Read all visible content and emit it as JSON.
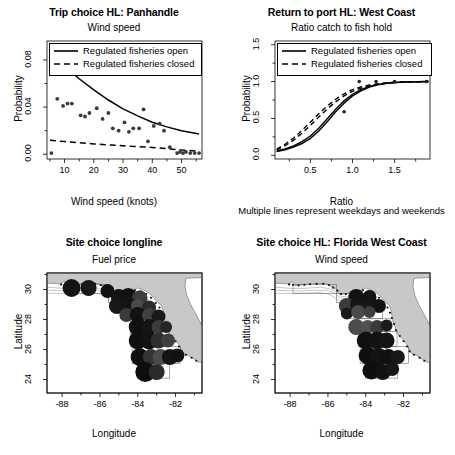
{
  "figure": {
    "note_text": "Multiple lines represent weekdays and weekends",
    "legend_open": "Regulated fisheries open",
    "legend_closed": "Regulated fisheries closed"
  },
  "chart_data": [
    {
      "id": "trip-choice-panhandle",
      "type": "scatter",
      "title": "Trip choice HL: Panhandle",
      "subtitle": "Wind speed",
      "xlabel": "Wind speed (knots)",
      "ylabel": "Probability",
      "xlim": [
        4,
        57
      ],
      "ylim": [
        -0.004,
        0.096
      ],
      "xticks": [
        10,
        20,
        30,
        40,
        50
      ],
      "xticklabels": [
        "10",
        "20",
        "30",
        "40",
        "50"
      ],
      "yticks": [
        0.0,
        0.04,
        0.08
      ],
      "yticklabels": [
        "0.00",
        "0.04",
        "0.08"
      ],
      "grid": false,
      "legend_position": "top-left",
      "legend": [
        "Regulated fisheries open",
        "Regulated fisheries closed"
      ],
      "points": [
        [
          5.5,
          0.001
        ],
        [
          7.5,
          0.047
        ],
        [
          9.5,
          0.041
        ],
        [
          11.0,
          0.043
        ],
        [
          12.5,
          0.043
        ],
        [
          15.5,
          0.033
        ],
        [
          17.0,
          0.032
        ],
        [
          18.5,
          0.035
        ],
        [
          21.0,
          0.039
        ],
        [
          23.0,
          0.03
        ],
        [
          25.0,
          0.035
        ],
        [
          26.5,
          0.022
        ],
        [
          28.5,
          0.02
        ],
        [
          30.5,
          0.027
        ],
        [
          32.0,
          0.019
        ],
        [
          33.5,
          0.022
        ],
        [
          35.5,
          0.022
        ],
        [
          37.0,
          0.038
        ],
        [
          38.5,
          0.011
        ],
        [
          40.5,
          0.024
        ],
        [
          42.5,
          0.026
        ],
        [
          44.0,
          0.02
        ],
        [
          46.0,
          0.006
        ],
        [
          48.5,
          0.001
        ],
        [
          49.5,
          0.002
        ],
        [
          50.5,
          0.001
        ],
        [
          51.5,
          0.002
        ],
        [
          53.0,
          0.001
        ],
        [
          54.5,
          0.001
        ],
        [
          56.0,
          0.001
        ]
      ],
      "series": [
        {
          "name": "Regulated fisheries open",
          "style": "solid",
          "curve": [
            [
              5,
              0.0855
            ],
            [
              10,
              0.0745
            ],
            [
              15,
              0.064
            ],
            [
              20,
              0.0545
            ],
            [
              25,
              0.046
            ],
            [
              30,
              0.0385
            ],
            [
              35,
              0.0325
            ],
            [
              40,
              0.0272
            ],
            [
              45,
              0.0232
            ],
            [
              50,
              0.02
            ],
            [
              56,
              0.0172
            ]
          ]
        },
        {
          "name": "Regulated fisheries closed",
          "style": "dashed",
          "curve": [
            [
              5,
              0.0118
            ],
            [
              10,
              0.0108
            ],
            [
              15,
              0.0098
            ],
            [
              20,
              0.0088
            ],
            [
              25,
              0.008
            ],
            [
              30,
              0.0072
            ],
            [
              35,
              0.0065
            ],
            [
              40,
              0.0058
            ],
            [
              45,
              0.0048
            ],
            [
              50,
              0.0036
            ],
            [
              56,
              0.0026
            ]
          ]
        }
      ]
    },
    {
      "id": "return-to-port-west-coast",
      "type": "line",
      "title": "Return to port HL: West Coast",
      "subtitle": "Ratio catch to fish hold",
      "xlabel": "Ratio",
      "ylabel": "Probability",
      "xlim": [
        0.08,
        1.92
      ],
      "ylim": [
        -0.05,
        1.55
      ],
      "xticks": [
        0.5,
        1.0,
        1.5
      ],
      "xticklabels": [
        "0.5",
        "1.0",
        "1.5"
      ],
      "yticks": [
        0.0,
        0.5,
        1.0,
        1.5
      ],
      "yticklabels": [
        "0.0",
        "0.5",
        "1.0",
        "1.5"
      ],
      "grid": false,
      "legend_position": "top-left",
      "legend": [
        "Regulated fisheries open",
        "Regulated fisheries closed"
      ],
      "points": [
        [
          0.9,
          0.59
        ],
        [
          1.08,
          1.0
        ],
        [
          1.28,
          1.0
        ],
        [
          1.5,
          1.0
        ],
        [
          1.88,
          1.0
        ]
      ],
      "series": [
        {
          "name": "Regulated fisheries open (weekday)",
          "style": "solid",
          "curve": [
            [
              0.1,
              0.05
            ],
            [
              0.2,
              0.075
            ],
            [
              0.3,
              0.11
            ],
            [
              0.4,
              0.16
            ],
            [
              0.5,
              0.23
            ],
            [
              0.6,
              0.33
            ],
            [
              0.7,
              0.455
            ],
            [
              0.8,
              0.59
            ],
            [
              0.9,
              0.705
            ],
            [
              1.0,
              0.805
            ],
            [
              1.1,
              0.875
            ],
            [
              1.2,
              0.925
            ],
            [
              1.3,
              0.955
            ],
            [
              1.4,
              0.975
            ],
            [
              1.5,
              0.985
            ],
            [
              1.65,
              0.995
            ],
            [
              1.9,
              1.0
            ]
          ]
        },
        {
          "name": "Regulated fisheries open (weekend)",
          "style": "solid",
          "curve": [
            [
              0.1,
              0.058
            ],
            [
              0.2,
              0.088
            ],
            [
              0.3,
              0.128
            ],
            [
              0.4,
              0.185
            ],
            [
              0.5,
              0.262
            ],
            [
              0.6,
              0.368
            ],
            [
              0.7,
              0.495
            ],
            [
              0.8,
              0.625
            ],
            [
              0.9,
              0.738
            ],
            [
              1.0,
              0.828
            ],
            [
              1.1,
              0.892
            ],
            [
              1.2,
              0.935
            ],
            [
              1.3,
              0.962
            ],
            [
              1.4,
              0.978
            ],
            [
              1.5,
              0.988
            ],
            [
              1.65,
              0.996
            ],
            [
              1.9,
              1.0
            ]
          ]
        },
        {
          "name": "Regulated fisheries closed (weekday)",
          "style": "dashed",
          "curve": [
            [
              0.1,
              0.072
            ],
            [
              0.2,
              0.13
            ],
            [
              0.3,
              0.205
            ],
            [
              0.4,
              0.3
            ],
            [
              0.5,
              0.405
            ],
            [
              0.6,
              0.518
            ],
            [
              0.7,
              0.628
            ],
            [
              0.8,
              0.725
            ],
            [
              0.9,
              0.805
            ],
            [
              1.0,
              0.868
            ],
            [
              1.1,
              0.912
            ],
            [
              1.2,
              0.942
            ],
            [
              1.3,
              0.963
            ],
            [
              1.4,
              0.977
            ],
            [
              1.5,
              0.987
            ],
            [
              1.65,
              0.995
            ],
            [
              1.9,
              1.0
            ]
          ]
        },
        {
          "name": "Regulated fisheries closed (weekend)",
          "style": "dashed",
          "curve": [
            [
              0.1,
              0.082
            ],
            [
              0.2,
              0.15
            ],
            [
              0.3,
              0.235
            ],
            [
              0.4,
              0.338
            ],
            [
              0.5,
              0.448
            ],
            [
              0.6,
              0.562
            ],
            [
              0.7,
              0.668
            ],
            [
              0.8,
              0.76
            ],
            [
              0.9,
              0.833
            ],
            [
              1.0,
              0.89
            ],
            [
              1.1,
              0.928
            ],
            [
              1.2,
              0.953
            ],
            [
              1.3,
              0.97
            ],
            [
              1.4,
              0.982
            ],
            [
              1.5,
              0.99
            ],
            [
              1.65,
              0.996
            ],
            [
              1.9,
              1.0
            ]
          ]
        }
      ]
    },
    {
      "id": "site-choice-longline",
      "type": "scatter",
      "title": "Site choice longline",
      "subtitle": "Fuel price",
      "xlabel": "Longitude",
      "ylabel": "Latitude",
      "xlim": [
        -88.8,
        -80.6
      ],
      "ylim": [
        23.1,
        31.1
      ],
      "xticks": [
        -88,
        -86,
        -84,
        -82
      ],
      "xticklabels": [
        "-88",
        "-86",
        "-84",
        "-82"
      ],
      "yticks": [
        24,
        26,
        28,
        30
      ],
      "yticklabels": [
        "24",
        "26",
        "28",
        "30"
      ],
      "grid": false,
      "bubbles": [
        [
          -87.5,
          30.1,
          9,
          "#141414"
        ],
        [
          -86.6,
          30.1,
          8,
          "#191919"
        ],
        [
          -85.6,
          29.9,
          7,
          "#111111"
        ],
        [
          -85.0,
          29.5,
          8,
          "#151515"
        ],
        [
          -84.5,
          29.5,
          9,
          "#121212"
        ],
        [
          -83.9,
          29.4,
          8,
          "#3d3d3d"
        ],
        [
          -85.1,
          28.9,
          8,
          "#181818"
        ],
        [
          -84.5,
          28.9,
          9,
          "#141414"
        ],
        [
          -84.0,
          28.9,
          7,
          "#4a4a4a"
        ],
        [
          -83.4,
          28.8,
          7,
          "#2b2b2b"
        ],
        [
          -84.6,
          28.3,
          7,
          "#3a3a3a"
        ],
        [
          -84.0,
          28.3,
          8,
          "#121212"
        ],
        [
          -83.4,
          28.3,
          7,
          "#414141"
        ],
        [
          -82.9,
          28.2,
          7,
          "#1a1a1a"
        ],
        [
          -84.0,
          27.5,
          9,
          "#101010"
        ],
        [
          -83.4,
          27.5,
          8,
          "#141414"
        ],
        [
          -82.9,
          27.5,
          7,
          "#3b3b3b"
        ],
        [
          -82.5,
          27.5,
          6,
          "#242424"
        ],
        [
          -84.0,
          26.6,
          9,
          "#0f0f0f"
        ],
        [
          -83.4,
          26.6,
          9,
          "#121212"
        ],
        [
          -82.9,
          26.6,
          8,
          "#2e2e2e"
        ],
        [
          -82.4,
          26.6,
          7,
          "#3f3f3f"
        ],
        [
          -83.9,
          25.5,
          9,
          "#101010"
        ],
        [
          -83.3,
          25.5,
          8,
          "#343434"
        ],
        [
          -82.8,
          25.5,
          8,
          "#4b4b4b"
        ],
        [
          -82.3,
          25.5,
          8,
          "#151515"
        ],
        [
          -81.9,
          25.6,
          7,
          "#121212"
        ],
        [
          -83.6,
          24.5,
          10,
          "#0e0e0e"
        ],
        [
          -83.0,
          24.5,
          8,
          "#2a2a2a"
        ]
      ]
    },
    {
      "id": "site-choice-hl-florida-west-coast",
      "type": "scatter",
      "title": "Site choice HL: Florida West Coast",
      "subtitle": "Wind speed",
      "xlabel": "Longitude",
      "ylabel": "Latitude",
      "xlim": [
        -88.8,
        -80.6
      ],
      "ylim": [
        23.1,
        31.1
      ],
      "xticks": [
        -88,
        -86,
        -84,
        -82
      ],
      "xticklabels": [
        "-88",
        "-86",
        "-84",
        "-82"
      ],
      "yticks": [
        24,
        26,
        28,
        30
      ],
      "yticklabels": [
        "24",
        "26",
        "28",
        "30"
      ],
      "grid": false,
      "bubbles": [
        [
          -84.5,
          29.5,
          8,
          "#121212"
        ],
        [
          -83.8,
          29.5,
          7,
          "#141414"
        ],
        [
          -85.0,
          28.9,
          8,
          "#3b3b3b"
        ],
        [
          -84.4,
          29.0,
          8,
          "#151515"
        ],
        [
          -83.9,
          28.9,
          8,
          "#161616"
        ],
        [
          -83.3,
          28.9,
          7,
          "#121212"
        ],
        [
          -85.0,
          28.4,
          6,
          "#191919"
        ],
        [
          -84.4,
          28.5,
          7,
          "#4a4a4a"
        ],
        [
          -83.8,
          28.5,
          6,
          "#3f3f3f"
        ],
        [
          -84.5,
          27.5,
          8,
          "#4c4c4c"
        ],
        [
          -83.9,
          27.5,
          7,
          "#505050"
        ],
        [
          -83.4,
          27.5,
          7,
          "#3a3a3a"
        ],
        [
          -82.9,
          27.6,
          6,
          "#1b1b1b"
        ],
        [
          -84.0,
          26.6,
          9,
          "#101010"
        ],
        [
          -83.4,
          26.6,
          9,
          "#121212"
        ],
        [
          -82.9,
          26.6,
          8,
          "#141414"
        ],
        [
          -83.9,
          25.6,
          9,
          "#0f0f0f"
        ],
        [
          -83.3,
          25.5,
          9,
          "#131313"
        ],
        [
          -82.8,
          25.5,
          8,
          "#111111"
        ],
        [
          -82.3,
          25.5,
          7,
          "#191919"
        ],
        [
          -83.7,
          24.6,
          9,
          "#0e0e0e"
        ],
        [
          -83.1,
          24.5,
          8,
          "#121212"
        ],
        [
          -82.6,
          24.7,
          7,
          "#161616"
        ]
      ]
    }
  ]
}
